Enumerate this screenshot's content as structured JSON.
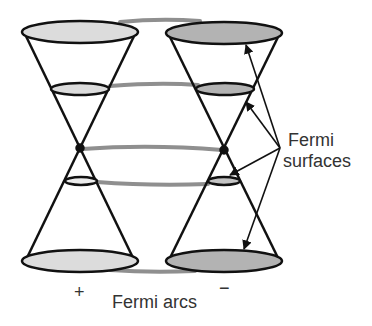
{
  "diagram": {
    "colors": {
      "outline": "#111111",
      "arc": "#8a8a8a",
      "fill_plus": "#dcdcdc",
      "fill_minus": "#b3b3b3",
      "text": "#333333"
    },
    "labels": {
      "fermi_surfaces_line1": "Fermi",
      "fermi_surfaces_line2": "surfaces",
      "fermi_arcs": "Fermi arcs",
      "plus": "+",
      "minus": "−"
    },
    "cones": [
      {
        "name": "plus",
        "chirality": "+",
        "center_x": 80,
        "node_y": 148
      },
      {
        "name": "minus",
        "chirality": "−",
        "center_x": 223,
        "node_y": 150
      }
    ],
    "slices": [
      "top",
      "upper-ring",
      "node",
      "lower-ring",
      "bottom"
    ],
    "arrows_to": [
      "top-ellipse",
      "upper-ring",
      "lower-ring",
      "bottom-ellipse"
    ]
  }
}
